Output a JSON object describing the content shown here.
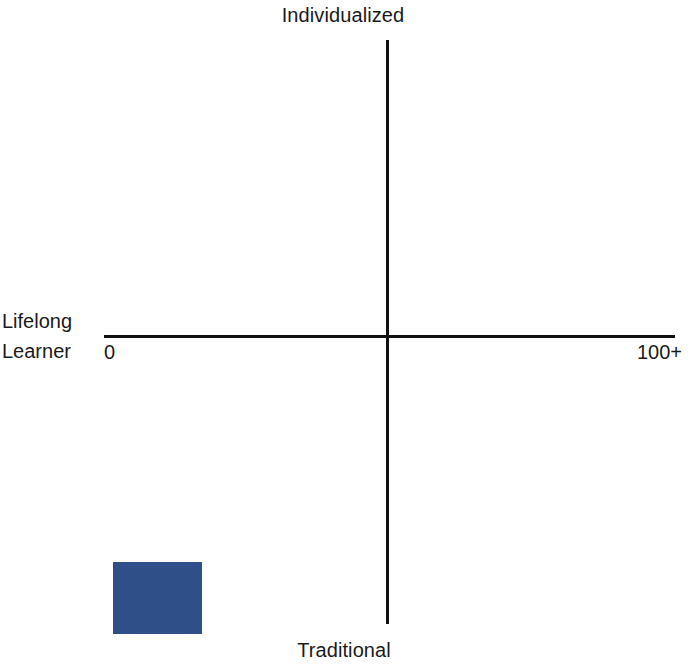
{
  "chart_data": {
    "type": "scatter",
    "title": "",
    "subtitle": "",
    "xlabel": "",
    "ylabel": "",
    "grid": false,
    "legend": false,
    "axis_labels": {
      "top": "Individualized",
      "bottom": "Traditional",
      "left_line1": "Lifelong",
      "left_line2": "Learner"
    },
    "x_tick_labels": [
      "0",
      "100+"
    ],
    "xlim": [
      0,
      100
    ],
    "ylim": [
      -100,
      100
    ],
    "quadrant_axes": {
      "vertical_label_high": "Individualized",
      "vertical_label_low": "Traditional",
      "horizontal_label_low": "Lifelong Learner"
    },
    "series": [
      {
        "name": "",
        "marker": "square",
        "color": "#2e4f87",
        "points": [
          {
            "x": 2,
            "y": -81,
            "label": ""
          }
        ]
      }
    ]
  },
  "colors": {
    "marker_blue": "#2e4f87",
    "axis_black": "#111111",
    "text_black": "#1a1a1a",
    "background": "#ffffff"
  },
  "marker_geometry": {
    "left_px": 113,
    "top_px": 562,
    "width_px": 89,
    "height_px": 72
  }
}
